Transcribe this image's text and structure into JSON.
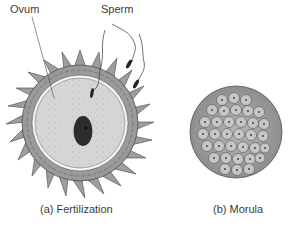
{
  "figure": {
    "labels": {
      "ovum": "Ovum",
      "sperm": "Sperm"
    },
    "captions": {
      "a": "(a) Fertilization",
      "b": "(b) Morula"
    },
    "colors": {
      "corona_cells": "#9a9a9a",
      "ovum_cytoplasm": "#d4d4d4",
      "zona": "#f4f4f4",
      "nucleus": "#2a2a2a",
      "morula": "#a8a8a8"
    }
  }
}
